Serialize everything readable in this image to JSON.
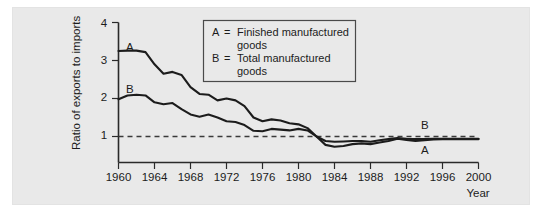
{
  "figure": {
    "background_color": "#e9e9e9",
    "line_color": "#1c1c1c"
  },
  "axes": {
    "y_title": "Ratio of exports to imports",
    "x_title": "Year",
    "y_ticks": [
      "1",
      "2",
      "3",
      "4"
    ],
    "x_ticks": [
      "1960",
      "1964",
      "1968",
      "1972",
      "1976",
      "1980",
      "1984",
      "1988",
      "1992",
      "1996",
      "2000"
    ]
  },
  "legend": {
    "entries": [
      {
        "key": "A",
        "eq": "=",
        "line1": "Finished manufactured",
        "line2": "goods"
      },
      {
        "key": "B",
        "eq": "=",
        "line1": "Total manufactured",
        "line2": "goods"
      }
    ]
  },
  "curve_labels": {
    "a_left": "A",
    "b_left": "B",
    "b_right": "B",
    "a_right": "A"
  },
  "chart_data": {
    "type": "line",
    "title": "",
    "xlabel": "Year",
    "ylabel": "Ratio of exports to imports",
    "xlim": [
      1960,
      2000
    ],
    "ylim": [
      0,
      4
    ],
    "yticks": [
      1,
      2,
      3,
      4
    ],
    "xticks": [
      1960,
      1964,
      1968,
      1972,
      1976,
      1980,
      1984,
      1988,
      1992,
      1996,
      2000
    ],
    "grid": false,
    "reference_line": {
      "y": 1.0,
      "style": "dashed"
    },
    "legend_position": "upper-center",
    "x": [
      1960,
      1961,
      1962,
      1963,
      1964,
      1965,
      1966,
      1967,
      1968,
      1969,
      1970,
      1971,
      1972,
      1973,
      1974,
      1975,
      1976,
      1977,
      1978,
      1979,
      1980,
      1981,
      1982,
      1983,
      1984,
      1985,
      1986,
      1987,
      1988,
      1989,
      1990,
      1991,
      1992,
      1993,
      1994,
      1995,
      1996,
      1997,
      1998,
      1999,
      2000
    ],
    "series": [
      {
        "name": "A = Finished manufactured goods",
        "label": "A",
        "values": [
          3.25,
          3.26,
          3.26,
          3.22,
          2.9,
          2.65,
          2.7,
          2.62,
          2.3,
          2.12,
          2.1,
          1.95,
          2.0,
          1.95,
          1.8,
          1.5,
          1.4,
          1.45,
          1.42,
          1.35,
          1.32,
          1.22,
          1.0,
          0.78,
          0.73,
          0.75,
          0.8,
          0.82,
          0.8,
          0.84,
          0.88,
          0.94,
          0.91,
          0.88,
          0.9,
          0.92,
          0.93,
          0.93,
          0.93,
          0.93,
          0.93
        ]
      },
      {
        "name": "B = Total manufactured goods",
        "label": "B",
        "values": [
          1.98,
          2.08,
          2.1,
          2.08,
          1.9,
          1.85,
          1.88,
          1.72,
          1.58,
          1.52,
          1.58,
          1.5,
          1.4,
          1.38,
          1.3,
          1.15,
          1.14,
          1.2,
          1.18,
          1.16,
          1.2,
          1.16,
          1.0,
          0.88,
          0.86,
          0.87,
          0.88,
          0.88,
          0.86,
          0.9,
          0.93,
          0.96,
          0.94,
          0.93,
          0.93,
          0.94,
          0.94,
          0.94,
          0.94,
          0.94,
          0.94
        ]
      }
    ]
  }
}
